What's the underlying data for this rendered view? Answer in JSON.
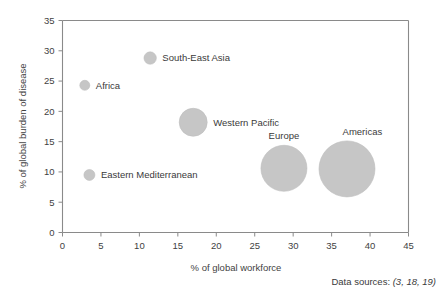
{
  "chart_data": {
    "type": "scatter",
    "title": "",
    "subtitle": "",
    "xlabel": "% of global workforce",
    "ylabel": "% of global burden of disease",
    "xlim": [
      0,
      45
    ],
    "ylim": [
      0,
      35
    ],
    "xticks": [
      "0",
      "5",
      "10",
      "15",
      "20",
      "25",
      "30",
      "35",
      "40",
      "45"
    ],
    "yticks": [
      "0",
      "5",
      "10",
      "15",
      "20",
      "25",
      "30",
      "35"
    ],
    "xtick_values": [
      0,
      5,
      10,
      15,
      20,
      25,
      30,
      35,
      40,
      45
    ],
    "ytick_values": [
      0,
      5,
      10,
      15,
      20,
      25,
      30,
      35
    ],
    "grid": false,
    "legend": "none",
    "bubble_encoding": "marker area represents relative region size",
    "bubble_color": "#c6c6c6",
    "points": [
      {
        "label": "Eastern Mediterranean",
        "x": 3.5,
        "y": 9.5,
        "size": 5.5,
        "label_position": "right"
      },
      {
        "label": "Africa",
        "x": 2.9,
        "y": 24.3,
        "size": 5.0,
        "label_position": "right"
      },
      {
        "label": "South-East Asia",
        "x": 11.4,
        "y": 28.8,
        "size": 6.2,
        "label_position": "right"
      },
      {
        "label": "Western Pacific",
        "x": 17.0,
        "y": 18.2,
        "size": 14.0,
        "label_position": "right"
      },
      {
        "label": "Europe",
        "x": 28.8,
        "y": 10.6,
        "size": 23.0,
        "label_position": "above"
      },
      {
        "label": "Americas",
        "x": 37.0,
        "y": 10.5,
        "size": 28.0,
        "label_position": "above-right"
      }
    ],
    "annotations": [
      {
        "name": "data-sources",
        "prefix": "Data sources: ",
        "refs": "(3, 18, 19)"
      }
    ]
  }
}
